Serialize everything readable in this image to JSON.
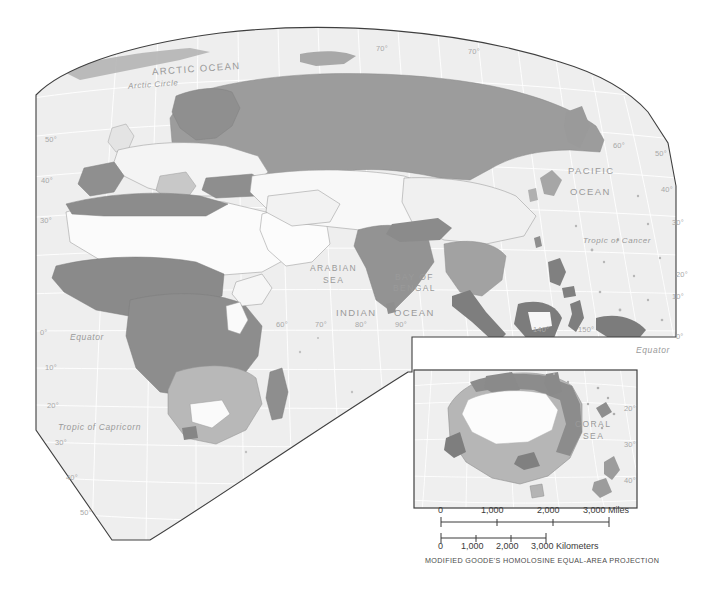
{
  "map": {
    "title_caption": "MODIFIED GOODE'S HOMOLOSINE EQUAL-AREA PROJECTION",
    "projection": "Modified Goode's Homolosine Equal-Area",
    "background_color": "#f2f2f2",
    "ocean_color": "#efefef",
    "graticule_color": "#ffffff",
    "border_color": "#4a4a4a",
    "shades": {
      "none": "#fbfbfb",
      "light": "#e6e6e6",
      "medium_light": "#d0d0d0",
      "medium": "#b4b4b4",
      "dark": "#9a9a9a",
      "darkest": "#808080"
    },
    "ocean_labels": [
      {
        "text": "ARCTIC  OCEAN",
        "x": 152,
        "y": 63,
        "size": 9.5,
        "caps": true,
        "rotate": -4
      },
      {
        "text": "Arctic Circle",
        "x": 128,
        "y": 80,
        "size": 8,
        "caps": false,
        "rotate": -4
      },
      {
        "text": "PACIFIC",
        "x": 568,
        "y": 165,
        "size": 9.5,
        "caps": true,
        "rotate": 0
      },
      {
        "text": "OCEAN",
        "x": 570,
        "y": 186,
        "size": 9.5,
        "caps": true,
        "rotate": 0
      },
      {
        "text": "Tropic of Cancer",
        "x": 583,
        "y": 236,
        "size": 8,
        "caps": false,
        "rotate": 0
      },
      {
        "text": "ARABIAN",
        "x": 310,
        "y": 263,
        "size": 8.5,
        "caps": true,
        "rotate": 0
      },
      {
        "text": "SEA",
        "x": 323,
        "y": 275,
        "size": 8.5,
        "caps": true,
        "rotate": 0
      },
      {
        "text": "BAY OF",
        "x": 395,
        "y": 272,
        "size": 8.5,
        "caps": true,
        "rotate": 0
      },
      {
        "text": "BENGAL",
        "x": 393,
        "y": 283,
        "size": 8.5,
        "caps": true,
        "rotate": 0
      },
      {
        "text": "INDIAN",
        "x": 336,
        "y": 307,
        "size": 9.5,
        "caps": true,
        "rotate": 0
      },
      {
        "text": "OCEAN",
        "x": 394,
        "y": 307,
        "size": 9.5,
        "caps": true,
        "rotate": 0
      },
      {
        "text": "Equator",
        "x": 70,
        "y": 332,
        "size": 8.5,
        "caps": false,
        "rotate": 0
      },
      {
        "text": "Equator",
        "x": 636,
        "y": 345,
        "size": 8.5,
        "caps": false,
        "rotate": 0
      },
      {
        "text": "Tropic of Capricorn",
        "x": 58,
        "y": 422,
        "size": 8.5,
        "caps": false,
        "rotate": 0
      },
      {
        "text": "CORAL",
        "x": 575,
        "y": 419,
        "size": 8.5,
        "caps": true,
        "rotate": 0
      },
      {
        "text": "SEA",
        "x": 583,
        "y": 431,
        "size": 8.5,
        "caps": true,
        "rotate": 0
      }
    ],
    "lat_ticks_left": [
      {
        "label": "50°",
        "x": 45,
        "y": 135
      },
      {
        "label": "40°",
        "x": 41,
        "y": 176
      },
      {
        "label": "30°",
        "x": 40,
        "y": 216
      },
      {
        "label": "0°",
        "x": 40,
        "y": 328
      },
      {
        "label": "10°",
        "x": 45,
        "y": 363
      },
      {
        "label": "20°",
        "x": 47,
        "y": 401
      },
      {
        "label": "30°",
        "x": 55,
        "y": 438
      },
      {
        "label": "40°",
        "x": 66,
        "y": 473
      },
      {
        "label": "50°",
        "x": 80,
        "y": 508
      }
    ],
    "lat_ticks_right": [
      {
        "label": "70°",
        "x": 468,
        "y": 47
      },
      {
        "label": "70°",
        "x": 376,
        "y": 44
      },
      {
        "label": "60°",
        "x": 613,
        "y": 141
      },
      {
        "label": "50°",
        "x": 655,
        "y": 149
      },
      {
        "label": "40°",
        "x": 661,
        "y": 185
      },
      {
        "label": "30°",
        "x": 672,
        "y": 218
      },
      {
        "label": "20°",
        "x": 676,
        "y": 270
      },
      {
        "label": "10°",
        "x": 672,
        "y": 292
      },
      {
        "label": "0°",
        "x": 676,
        "y": 332
      }
    ],
    "lon_ticks": [
      {
        "label": "60°",
        "x": 276,
        "y": 320
      },
      {
        "label": "70°",
        "x": 315,
        "y": 320
      },
      {
        "label": "80°",
        "x": 355,
        "y": 320
      },
      {
        "label": "90°",
        "x": 395,
        "y": 320
      },
      {
        "label": "140°",
        "x": 533,
        "y": 325
      },
      {
        "label": "150°",
        "x": 578,
        "y": 325
      }
    ],
    "inset": {
      "name": "australia-inset",
      "x": 414,
      "y": 370,
      "width": 223,
      "height": 138,
      "lat_ticks": [
        {
          "label": "20°",
          "x": 624,
          "y": 404
        },
        {
          "label": "30°",
          "x": 624,
          "y": 440
        },
        {
          "label": "40°",
          "x": 624,
          "y": 476
        }
      ]
    }
  },
  "scale_bars": [
    {
      "name": "miles",
      "unit": "Miles",
      "labels": [
        "0",
        "1,000",
        "2,000",
        "3,000"
      ],
      "unit_label": "3,000 Miles"
    },
    {
      "name": "kilometers",
      "unit": "Kilometers",
      "labels": [
        "0",
        "1,000",
        "2,000",
        "3,000"
      ],
      "unit_label": "3,000 Kilometers"
    }
  ],
  "scale_text": {
    "miles_0": "0",
    "miles_1000": "1,000",
    "miles_2000": "2,000",
    "miles_3000": "3,000 Miles",
    "km_0": "0",
    "km_1000": "1,000",
    "km_2000": "2,000",
    "km_3000": "3,000 Kilometers"
  }
}
